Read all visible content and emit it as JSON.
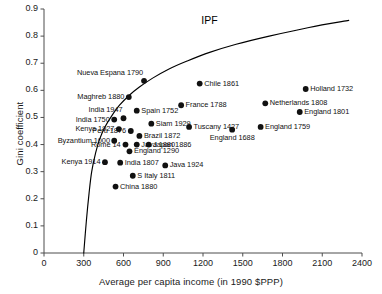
{
  "chart_data": {
    "type": "scatter",
    "title": "",
    "xlabel": "Average per capita income (in 1990 $PPP)",
    "ylabel": "Gini coefficient",
    "xlim": [
      0,
      2400
    ],
    "ylim": [
      0,
      0.9
    ],
    "xticks": [
      0,
      300,
      600,
      900,
      1200,
      1500,
      1800,
      2100,
      2400
    ],
    "yticks": [
      "0",
      "0.1",
      "0.2",
      "0.3",
      "0.4",
      "0.5",
      "0.6",
      "0.7",
      "0.8",
      "0.9"
    ],
    "grid": false,
    "legend": "none",
    "annotations": [
      {
        "text": "IPF",
        "x": 1270,
        "y": 0.855
      }
    ],
    "curve": {
      "name": "IPF",
      "label": "Inequality Possibility Frontier",
      "points": [
        [
          300,
          0.0
        ],
        [
          320,
          0.12
        ],
        [
          340,
          0.22
        ],
        [
          360,
          0.3
        ],
        [
          390,
          0.37
        ],
        [
          420,
          0.42
        ],
        [
          460,
          0.465
        ],
        [
          510,
          0.505
        ],
        [
          570,
          0.545
        ],
        [
          640,
          0.58
        ],
        [
          720,
          0.612
        ],
        [
          820,
          0.645
        ],
        [
          940,
          0.678
        ],
        [
          1080,
          0.708
        ],
        [
          1250,
          0.74
        ],
        [
          1450,
          0.77
        ],
        [
          1700,
          0.8
        ],
        [
          2000,
          0.832
        ],
        [
          2300,
          0.858
        ]
      ]
    },
    "points": [
      {
        "label": "Nueva Espana 1790",
        "x": 755,
        "y": 0.635,
        "label_pos": "above-left"
      },
      {
        "label": "Maghreb 1880",
        "x": 640,
        "y": 0.575,
        "label_pos": "left"
      },
      {
        "label": "Chile 1861",
        "x": 1175,
        "y": 0.625,
        "label_pos": "right"
      },
      {
        "label": "Holland 1732",
        "x": 1975,
        "y": 0.605,
        "label_pos": "right"
      },
      {
        "label": "France 1788",
        "x": 1035,
        "y": 0.545,
        "label_pos": "right"
      },
      {
        "label": "Netherlands 1808",
        "x": 1670,
        "y": 0.552,
        "label_pos": "right"
      },
      {
        "label": "England 1801",
        "x": 1930,
        "y": 0.52,
        "label_pos": "right"
      },
      {
        "label": "Spain 1752",
        "x": 700,
        "y": 0.525,
        "label_pos": "right"
      },
      {
        "label": "India 1947",
        "x": 600,
        "y": 0.497,
        "label_pos": "above-left"
      },
      {
        "label": "India 1750",
        "x": 530,
        "y": 0.492,
        "label_pos": "left"
      },
      {
        "label": "Siam 1929",
        "x": 810,
        "y": 0.477,
        "label_pos": "right"
      },
      {
        "label": "Tuscany 1427",
        "x": 1095,
        "y": 0.465,
        "label_pos": "right"
      },
      {
        "label": "England 1759",
        "x": 1635,
        "y": 0.465,
        "label_pos": "right"
      },
      {
        "label": "Kenya 1927",
        "x": 565,
        "y": 0.457,
        "label_pos": "left"
      },
      {
        "label": "Peru 1876",
        "x": 655,
        "y": 0.45,
        "label_pos": "left"
      },
      {
        "label": "Brazil 1872",
        "x": 720,
        "y": 0.432,
        "label_pos": "right"
      },
      {
        "label": "Byzantium 1000",
        "x": 530,
        "y": 0.414,
        "label_pos": "left"
      },
      {
        "label": "Rome 14",
        "x": 615,
        "y": 0.4,
        "label_pos": "left"
      },
      {
        "label": "Java 1880",
        "x": 700,
        "y": 0.4,
        "label_pos": "right"
      },
      {
        "label": "Japan 1886",
        "x": 790,
        "y": 0.4,
        "label_pos": "right"
      },
      {
        "label": "England 1688",
        "x": 1420,
        "y": 0.455,
        "label_pos": "below"
      },
      {
        "label": "England 1290",
        "x": 645,
        "y": 0.375,
        "label_pos": "right"
      },
      {
        "label": "Kenya 1914",
        "x": 460,
        "y": 0.335,
        "label_pos": "left"
      },
      {
        "label": "India 1807",
        "x": 575,
        "y": 0.333,
        "label_pos": "right"
      },
      {
        "label": "Java 1924",
        "x": 915,
        "y": 0.323,
        "label_pos": "right"
      },
      {
        "label": "S Italy 1811",
        "x": 670,
        "y": 0.285,
        "label_pos": "right"
      },
      {
        "label": "China 1880",
        "x": 540,
        "y": 0.245,
        "label_pos": "right"
      }
    ]
  },
  "style": {
    "marker_color": "#111111",
    "curve_color": "#000000",
    "axis_color": "#4d4d4d",
    "background": "#ffffff"
  }
}
